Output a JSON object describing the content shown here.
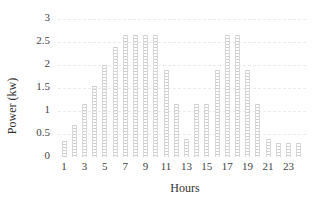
{
  "chart_data": {
    "type": "bar",
    "title": "",
    "xlabel": "Hours",
    "ylabel": "Power (kw)",
    "ylim": [
      0,
      3
    ],
    "yticks": [
      "0",
      "0.5",
      "1",
      "1.5",
      "2",
      "2.5",
      "3"
    ],
    "xticks": [
      "1",
      "3",
      "5",
      "7",
      "9",
      "11",
      "13",
      "15",
      "17",
      "19",
      "21",
      "23"
    ],
    "grid": true,
    "legend": null,
    "categories": [
      1,
      2,
      3,
      4,
      5,
      6,
      7,
      8,
      9,
      10,
      11,
      12,
      13,
      14,
      15,
      16,
      17,
      18,
      19,
      20,
      21,
      22,
      23,
      24
    ],
    "values": [
      0.35,
      0.7,
      1.15,
      1.55,
      2.0,
      2.4,
      2.65,
      2.65,
      2.65,
      2.65,
      1.9,
      1.15,
      0.4,
      1.15,
      1.15,
      1.9,
      2.65,
      2.65,
      1.9,
      1.15,
      0.4,
      0.3,
      0.3,
      0.3
    ]
  },
  "labels": {
    "ylabel": "Power (kw)",
    "xlabel": "Hours"
  }
}
